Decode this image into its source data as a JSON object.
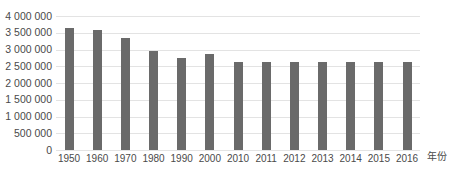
{
  "chart_data": {
    "type": "bar",
    "title": "",
    "xlabel": "年份",
    "ylabel": "",
    "categories": [
      "1950",
      "1960",
      "1970",
      "1980",
      "1990",
      "2000",
      "2010",
      "2011",
      "2012",
      "2013",
      "2014",
      "2015",
      "2016"
    ],
    "values": [
      3650000,
      3570000,
      3350000,
      2970000,
      2750000,
      2880000,
      2620000,
      2640000,
      2640000,
      2640000,
      2640000,
      2630000,
      2630000
    ],
    "ylim": [
      0,
      4000000
    ],
    "ytick_step": 500000,
    "ytick_labels_top_to_bottom": [
      "4 000 000",
      "3 500 000",
      "3 000 000",
      "2 500 000",
      "2 000 000",
      "1 500 000",
      "1 000 000",
      "500 000",
      "0"
    ],
    "grid": true,
    "legend_position": "none",
    "colors": {
      "bar": "#6a6a6a",
      "gridline": "#e3e3e3",
      "axis_text": "#4a4a4a",
      "background": "#ffffff"
    }
  }
}
